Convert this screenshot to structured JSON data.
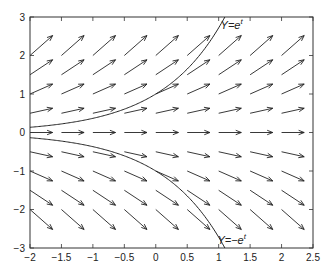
{
  "chart_data": {
    "type": "vector_field",
    "title": "",
    "xlabel": "",
    "ylabel": "",
    "xlim": [
      -2,
      2.5
    ],
    "ylim": [
      -3,
      3
    ],
    "grid": false,
    "equation": "dY/dt = Y",
    "x_ticks": [
      -2,
      -1.5,
      -1,
      -0.5,
      0,
      0.5,
      1,
      1.5,
      2,
      2.5
    ],
    "x_tick_labels": [
      "-2",
      "-1.5",
      "-1",
      "-0.5",
      "0",
      "0.5",
      "1",
      "1.5",
      "2",
      "2.5"
    ],
    "y_ticks": [
      -3,
      -2,
      -1,
      0,
      1,
      2,
      3
    ],
    "y_tick_labels": [
      "-3",
      "-2",
      "-1",
      "0",
      "1",
      "2",
      "3"
    ],
    "field_grid": {
      "t": [
        -2,
        -1.5,
        -1,
        -0.5,
        0,
        0.5,
        1,
        1.5,
        2
      ],
      "y": [
        -2,
        -1.5,
        -1,
        -0.5,
        0,
        0.5,
        1,
        1.5,
        2
      ],
      "vector": "(1, Y) scaled",
      "scale": 0.36
    },
    "series": [
      {
        "name": "Y=e^t",
        "function": "exp",
        "sign": 1,
        "label": "Y=e",
        "label_sup": "t",
        "label_pos": [
          1.03,
          2.78
        ]
      },
      {
        "name": "Y=-e^t",
        "function": "exp",
        "sign": -1,
        "label": "Y=−e",
        "label_sup": "t",
        "label_pos": [
          0.98,
          -2.78
        ]
      }
    ],
    "colors": {
      "axes": "#333333",
      "arrows": "#222222",
      "curves": "#222222",
      "background": "#ffffff"
    }
  }
}
